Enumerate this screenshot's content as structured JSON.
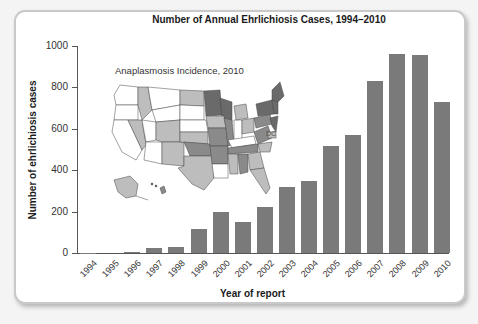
{
  "chart_data": {
    "type": "bar",
    "title": "Number of Annual Ehrlichiosis Cases, 1994–2010",
    "xlabel": "Year of report",
    "ylabel": "Number of ehrlichiosis cases",
    "ylim": [
      0,
      1000
    ],
    "yticks": [
      "0",
      "200",
      "400",
      "600",
      "800",
      "1000"
    ],
    "grid": false,
    "categories": [
      "1994",
      "1995",
      "1996",
      "1997",
      "1998",
      "1999",
      "2000",
      "2001",
      "2002",
      "2003",
      "2004",
      "2005",
      "2006",
      "2007",
      "2008",
      "2009",
      "2010"
    ],
    "values": [
      2,
      0,
      3,
      25,
      30,
      115,
      200,
      150,
      220,
      320,
      350,
      515,
      570,
      830,
      960,
      955,
      730
    ],
    "bar_color": "#7a7a7a",
    "inset": {
      "title": "Anaplasmosis Incidence, 2010",
      "type": "choropleth map of United States",
      "label_dc": "DC"
    }
  }
}
